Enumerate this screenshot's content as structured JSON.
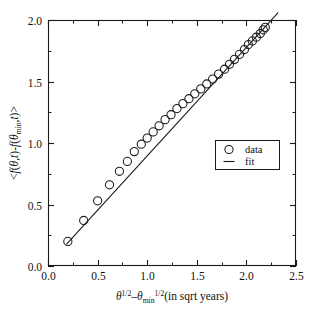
{
  "chart_data": {
    "type": "scatter",
    "title": "",
    "xlabel": "θ^1/2 − θ_min^1/2  (in sqrt years)",
    "ylabel": "<f(θ,t)-f(θ_min,t)>",
    "xlim": [
      0.0,
      2.5
    ],
    "ylim": [
      0.0,
      2.0
    ],
    "xticks": [
      0.0,
      0.5,
      1.0,
      1.5,
      2.0,
      2.5
    ],
    "xticklabels": [
      "0.0",
      "0.5",
      "1.0",
      "1.5",
      "2.0",
      "2.5"
    ],
    "yticks": [
      0.0,
      0.5,
      1.0,
      1.5,
      2.0
    ],
    "yticklabels": [
      "0.0",
      "0.5",
      "1.0",
      "1.5",
      "2.0"
    ],
    "x_minor_step": 0.25,
    "y_minor_step": 0.25,
    "grid": false,
    "legend_position": "center-right",
    "series": [
      {
        "name": "data",
        "type": "scatter",
        "marker": "open-circle",
        "color": "#1a1a1a",
        "x": [
          0.2,
          0.36,
          0.5,
          0.62,
          0.72,
          0.8,
          0.87,
          0.94,
          1.0,
          1.06,
          1.12,
          1.18,
          1.24,
          1.3,
          1.36,
          1.42,
          1.48,
          1.54,
          1.6,
          1.66,
          1.72,
          1.78,
          1.83,
          1.88,
          1.93,
          1.98,
          2.02,
          2.06,
          2.1,
          2.14,
          2.17,
          2.19
        ],
        "y": [
          0.2,
          0.37,
          0.53,
          0.66,
          0.77,
          0.85,
          0.93,
          0.99,
          1.04,
          1.09,
          1.14,
          1.19,
          1.23,
          1.28,
          1.32,
          1.36,
          1.4,
          1.44,
          1.48,
          1.52,
          1.56,
          1.6,
          1.64,
          1.68,
          1.72,
          1.76,
          1.8,
          1.83,
          1.86,
          1.89,
          1.92,
          1.94
        ]
      },
      {
        "name": "fit",
        "type": "line",
        "color": "#1a1a1a",
        "x": [
          0.185,
          2.32
        ],
        "y": [
          0.175,
          2.06
        ],
        "slope": 0.881,
        "intercept": 0.012
      }
    ]
  },
  "axes": {
    "x_axis_label_parts": {
      "theta": "θ",
      "exp1": "1/2",
      "minus": "–",
      "theta2": "θ",
      "sub": "min",
      "exp2": "1/2",
      "units": "(in sqrt years)"
    },
    "y_axis_label_parts": {
      "open": "<",
      "f1": "f",
      "arg1_open": "(",
      "theta": "θ",
      "comma": ",",
      "t1": "t",
      "arg1_close": ")",
      "minus": "-",
      "f2": "f",
      "arg2_open": "(",
      "theta2": "θ",
      "sub": "min",
      "comma2": ",",
      "t2": "t",
      "arg2_close": ")",
      "close": ">"
    }
  },
  "legend": {
    "entries": [
      {
        "label": "data",
        "marker": "open-circle"
      },
      {
        "label": "fit",
        "marker": "line"
      }
    ]
  },
  "colors": {
    "foreground": "#1a1a1a",
    "background": "#ffffff"
  }
}
